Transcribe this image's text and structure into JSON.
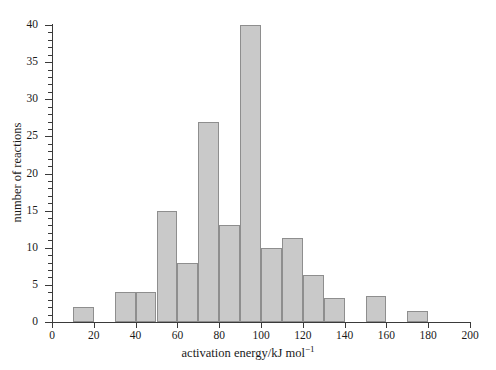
{
  "chart_data": {
    "type": "bar",
    "title": "",
    "xlabel": "activation energy/kJ mol⁻¹",
    "xlabel_text": "activation energy/kJ mol",
    "xlabel_exponent": "−1",
    "ylabel": "number of reactions",
    "xlim": [
      0,
      200
    ],
    "ylim": [
      0,
      40
    ],
    "grid": false,
    "legend": null,
    "bin_width": 10,
    "x_major_ticks": [
      0,
      20,
      40,
      60,
      80,
      100,
      120,
      140,
      160,
      180,
      200
    ],
    "x_tick_labels": [
      "0",
      "20",
      "40",
      "60",
      "80",
      "100",
      "120",
      "140",
      "160",
      "180",
      "200"
    ],
    "y_major_ticks": [
      0,
      5,
      10,
      15,
      20,
      25,
      30,
      35,
      40
    ],
    "y_tick_labels": [
      "0",
      "5",
      "10",
      "15",
      "20",
      "25",
      "30",
      "35",
      "40"
    ],
    "y_minor_tick_step": 1,
    "bar_fill_color": "#c9c9c9",
    "bar_edge_color": "#8e8e8e",
    "axis_color": "#3a3a3a",
    "background_color": "#ffffff",
    "bins": [
      {
        "x0": 10,
        "x1": 20,
        "value": 2
      },
      {
        "x0": 30,
        "x1": 40,
        "value": 4
      },
      {
        "x0": 40,
        "x1": 50,
        "value": 4
      },
      {
        "x0": 50,
        "x1": 60,
        "value": 15
      },
      {
        "x0": 60,
        "x1": 70,
        "value": 8
      },
      {
        "x0": 70,
        "x1": 80,
        "value": 27
      },
      {
        "x0": 80,
        "x1": 90,
        "value": 13
      },
      {
        "x0": 90,
        "x1": 100,
        "value": 40
      },
      {
        "x0": 100,
        "x1": 110,
        "value": 10
      },
      {
        "x0": 110,
        "x1": 120,
        "value": 11.3
      },
      {
        "x0": 120,
        "x1": 130,
        "value": 6.3
      },
      {
        "x0": 130,
        "x1": 140,
        "value": 3.3
      },
      {
        "x0": 150,
        "x1": 160,
        "value": 3.5
      },
      {
        "x0": 170,
        "x1": 180,
        "value": 1.5
      }
    ],
    "empty_bins": [
      {
        "x0": 0,
        "x1": 10
      },
      {
        "x0": 20,
        "x1": 30
      },
      {
        "x0": 140,
        "x1": 150
      },
      {
        "x0": 160,
        "x1": 170
      },
      {
        "x0": 180,
        "x1": 200
      }
    ]
  }
}
